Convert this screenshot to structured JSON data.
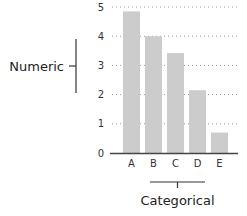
{
  "chart_data": {
    "type": "bar",
    "title": "",
    "xlabel": "",
    "ylabel": "",
    "categories": [
      "A",
      "B",
      "C",
      "D",
      "E"
    ],
    "values": [
      4.85,
      4.0,
      3.42,
      2.15,
      0.7
    ],
    "ylim": [
      0,
      5
    ],
    "yticks": [
      "0",
      "1",
      "2",
      "3",
      "4",
      "5"
    ],
    "grid": "horizontal dotted",
    "bar_color": "#cccccc",
    "annotations": [
      {
        "label": "Numeric",
        "target": "y-axis",
        "side": "left"
      },
      {
        "label": "Categorical",
        "target": "x-axis",
        "side": "bottom"
      }
    ]
  }
}
